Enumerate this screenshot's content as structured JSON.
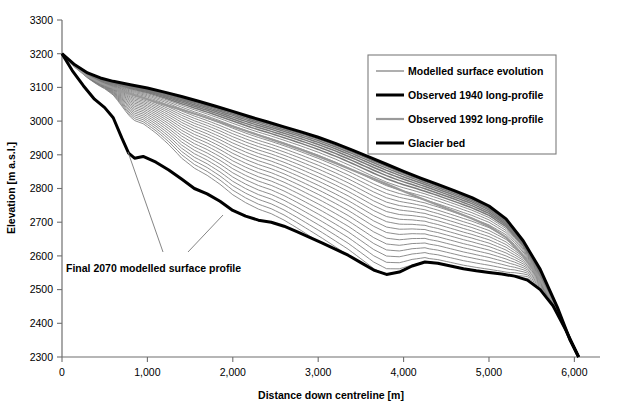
{
  "chart_data": {
    "type": "line",
    "title": "",
    "xlabel": "Distance down centreline [m]",
    "ylabel": "Elevation [m a.s.l.]",
    "xlim": [
      0,
      6300
    ],
    "ylim": [
      2300,
      3300
    ],
    "xticks": [
      0,
      1000,
      2000,
      3000,
      4000,
      5000,
      6000
    ],
    "xtick_labels": [
      "0",
      "1,000",
      "2,000",
      "3,000",
      "4,000",
      "5,000",
      "6,000"
    ],
    "yticks": [
      2300,
      2400,
      2500,
      2600,
      2700,
      2800,
      2900,
      3000,
      3100,
      3200,
      3300
    ],
    "ytick_labels": [
      "2300",
      "2400",
      "2500",
      "2600",
      "2700",
      "2800",
      "2900",
      "3000",
      "3100",
      "3200",
      "3300"
    ],
    "grid": false,
    "legend_position": "upper-right",
    "legend": [
      {
        "label": "Modelled surface evolution",
        "color": "#7a7a7a",
        "width": 1.2
      },
      {
        "label": "Observed 1940 long-profile",
        "color": "#000000",
        "width": 3.0
      },
      {
        "label": "Observed 1992 long-profile",
        "color": "#9a9a9a",
        "width": 2.2
      },
      {
        "label": "Glacier bed",
        "color": "#000000",
        "width": 3.0
      }
    ],
    "annotations": [
      {
        "text": "Final 2070 modelled surface profile",
        "x": 1250,
        "y": 2555
      }
    ],
    "series": [
      {
        "name": "Observed 1940 long-profile",
        "x": [
          0,
          150,
          300,
          450,
          600,
          800,
          1000,
          1200,
          1400,
          1600,
          1800,
          2000,
          2200,
          2400,
          2600,
          2800,
          3000,
          3200,
          3400,
          3600,
          3800,
          4000,
          4200,
          4400,
          4600,
          4800,
          5000,
          5200,
          5400,
          5600,
          5800,
          5950,
          6050
        ],
        "y": [
          3200,
          3167,
          3143,
          3128,
          3118,
          3108,
          3098,
          3086,
          3073,
          3059,
          3044,
          3029,
          3013,
          2998,
          2983,
          2968,
          2952,
          2934,
          2914,
          2893,
          2872,
          2851,
          2831,
          2812,
          2793,
          2773,
          2748,
          2710,
          2645,
          2560,
          2448,
          2350,
          2300
        ]
      },
      {
        "name": "Observed 1992 long-profile",
        "x": [
          0,
          150,
          300,
          450,
          600,
          800,
          1000,
          1200,
          1400,
          1600,
          1800,
          2000,
          2200,
          2400,
          2600,
          2800,
          3000,
          3200,
          3400,
          3600,
          3800,
          4000,
          4200,
          4400,
          4600,
          4800,
          5000,
          5200,
          5400,
          5600,
          5800,
          5950,
          6050
        ],
        "y": [
          3200,
          3162,
          3133,
          3113,
          3098,
          3081,
          3065,
          3049,
          3034,
          3018,
          3001,
          2984,
          2967,
          2950,
          2933,
          2915,
          2896,
          2876,
          2855,
          2834,
          2813,
          2792,
          2771,
          2751,
          2731,
          2711,
          2688,
          2655,
          2600,
          2531,
          2435,
          2348,
          2300
        ]
      },
      {
        "name": "Glacier bed",
        "x": [
          0,
          120,
          250,
          380,
          500,
          600,
          700,
          780,
          850,
          950,
          1100,
          1250,
          1400,
          1550,
          1700,
          1850,
          2000,
          2150,
          2300,
          2450,
          2600,
          2750,
          2900,
          3050,
          3200,
          3350,
          3500,
          3650,
          3800,
          3950,
          4100,
          4250,
          4400,
          4550,
          4700,
          4850,
          5000,
          5150,
          5300,
          5450,
          5600,
          5750,
          5900,
          6050
        ],
        "y": [
          3200,
          3150,
          3105,
          3065,
          3040,
          3010,
          2950,
          2905,
          2890,
          2895,
          2878,
          2855,
          2828,
          2800,
          2784,
          2762,
          2735,
          2718,
          2706,
          2700,
          2688,
          2672,
          2655,
          2638,
          2620,
          2602,
          2580,
          2558,
          2545,
          2552,
          2570,
          2582,
          2578,
          2570,
          2562,
          2556,
          2551,
          2546,
          2540,
          2528,
          2500,
          2452,
          2380,
          2300
        ]
      }
    ],
    "modelled_surface_evolution": {
      "description": "Family of 28 modelled surface profiles fanning downward from the 1940 profile toward the final 2070 profile",
      "count": 28,
      "first_year": 1940,
      "last_year": 2070
    }
  },
  "axes": {
    "x_title": "Distance down centreline [m]",
    "y_title": "Elevation [m a.s.l.]"
  }
}
